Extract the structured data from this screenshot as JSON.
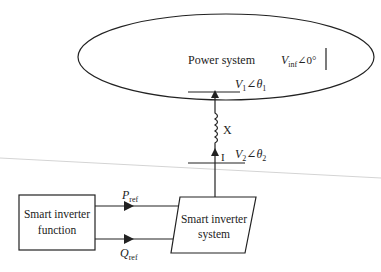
{
  "diagram": {
    "type": "block-diagram",
    "power_system": {
      "label": "Power system",
      "infinite_bus": {
        "symbol": "V",
        "subscript": "inf",
        "angle": "∠0°"
      }
    },
    "bus1": {
      "symbol": "V",
      "subscript": "1",
      "angle": "∠θ",
      "angle_subscript": "1"
    },
    "reactance": {
      "label": "X"
    },
    "current": {
      "label": "I"
    },
    "bus2": {
      "symbol": "V",
      "subscript": "2",
      "angle": "∠θ",
      "angle_subscript": "2"
    },
    "function_block": {
      "line1": "Smart inverter",
      "line2": "function"
    },
    "system_block": {
      "line1": "Smart inverter",
      "line2": "system"
    },
    "signals": {
      "p": {
        "symbol": "P",
        "subscript": "ref"
      },
      "q": {
        "symbol": "Q",
        "subscript": "ref"
      }
    },
    "colors": {
      "stroke": "#222222",
      "faint_line": "#cfcfcf"
    }
  }
}
